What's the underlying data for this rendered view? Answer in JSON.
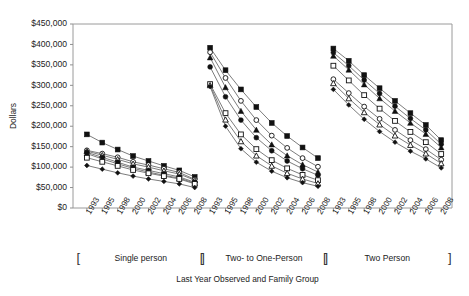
{
  "chart_data": {
    "type": "line",
    "title": "",
    "xlabel": "Last Year Observed and Family Group",
    "ylabel": "Dollars",
    "ylim": [
      0,
      450000
    ],
    "ytick_labels": [
      "$0",
      "$50,000",
      "$100,000",
      "$150,000",
      "$200,000",
      "$250,000",
      "$300,000",
      "$350,000",
      "$400,000",
      "$450,000"
    ],
    "ytick_values": [
      0,
      50000,
      100000,
      150000,
      200000,
      250000,
      300000,
      350000,
      400000,
      450000
    ],
    "grid": false,
    "legend": "none",
    "categories": [
      "1993",
      "1995",
      "1998",
      "2000",
      "2002",
      "2004",
      "2006",
      "2008"
    ],
    "groups": [
      {
        "name": "Single person",
        "x_labels": [
          "1993",
          "1995",
          "1998",
          "2000",
          "2002",
          "2004",
          "2006",
          "2008"
        ],
        "series": [
          {
            "name": "series-1",
            "marker": "filled-square",
            "values": [
              180000,
              160000,
              143000,
              127000,
              115000,
              103000,
              92000,
              76000
            ]
          },
          {
            "name": "series-2",
            "marker": "open-circle",
            "values": [
              141000,
              133000,
              124000,
              113000,
              105000,
              96000,
              87000,
              70000
            ]
          },
          {
            "name": "series-3",
            "marker": "open-triangle",
            "values": [
              139000,
              129000,
              119000,
              108000,
              100000,
              91000,
              83000,
              68000
            ]
          },
          {
            "name": "series-4",
            "marker": "filled-circle",
            "values": [
              136000,
              124000,
              112000,
              100000,
              92000,
              84000,
              76000,
              63000
            ]
          },
          {
            "name": "series-5",
            "marker": "filled-triangle",
            "values": [
              133000,
              120000,
              108000,
              97000,
              88000,
              80000,
              73000,
              61000
            ]
          },
          {
            "name": "series-6",
            "marker": "open-square",
            "values": [
              123000,
              113000,
              103000,
              93000,
              85000,
              78000,
              71000,
              59000
            ]
          },
          {
            "name": "series-7",
            "marker": "filled-diamond",
            "values": [
              104000,
              95000,
              86000,
              78000,
              71000,
              65000,
              59000,
              50000
            ]
          }
        ]
      },
      {
        "name": "Two- to One-Person",
        "x_labels": [
          "1993",
          "1995",
          "1998",
          "2000",
          "2002",
          "2004",
          "2006",
          "2008"
        ],
        "series": [
          {
            "name": "series-1",
            "marker": "filled-square",
            "values": [
              392000,
              337000,
              290000,
              247000,
              208000,
              176000,
              148000,
              122000
            ]
          },
          {
            "name": "series-2",
            "marker": "open-circle",
            "values": [
              381000,
              318000,
              262000,
              215000,
              177000,
              147000,
              122000,
              101000
            ]
          },
          {
            "name": "series-3",
            "marker": "filled-triangle",
            "values": [
              368000,
              295000,
              237000,
              191000,
              155000,
              128000,
              106000,
              88000
            ]
          },
          {
            "name": "series-4",
            "marker": "filled-circle",
            "values": [
              345000,
              272000,
              215000,
              172000,
              140000,
              115000,
              96000,
              80000
            ]
          },
          {
            "name": "series-5",
            "marker": "open-square",
            "values": [
              303000,
              232000,
              180000,
              144000,
              117000,
              97000,
              81000,
              68000
            ]
          },
          {
            "name": "series-6",
            "marker": "open-triangle",
            "values": [
              300000,
              216000,
              163000,
              128000,
              103000,
              85000,
              71000,
              60000
            ]
          },
          {
            "name": "series-7",
            "marker": "filled-diamond",
            "values": [
              297000,
              200000,
              145000,
              112000,
              90000,
              74000,
              62000,
              53000
            ]
          }
        ]
      },
      {
        "name": "Two Person",
        "x_labels": [
          "1993",
          "1995",
          "1998",
          "2000",
          "2002",
          "2004",
          "2006",
          "2008"
        ],
        "series": [
          {
            "name": "series-1",
            "marker": "filled-square",
            "values": [
              390000,
              360000,
              325000,
              293000,
              262000,
              232000,
              203000,
              166000
            ]
          },
          {
            "name": "series-2",
            "marker": "filled-circle",
            "values": [
              380000,
              348000,
              313000,
              280000,
              249000,
              219000,
              191000,
              156000
            ]
          },
          {
            "name": "series-3",
            "marker": "filled-triangle",
            "values": [
              372000,
              338000,
              302000,
              268000,
              237000,
              208000,
              181000,
              148000
            ]
          },
          {
            "name": "series-4",
            "marker": "open-square",
            "values": [
              348000,
              312000,
              276000,
              243000,
              213000,
              186000,
              161000,
              132000
            ]
          },
          {
            "name": "series-5",
            "marker": "open-circle",
            "values": [
              315000,
              281000,
              248000,
              218000,
              191000,
              166000,
              144000,
              118000
            ]
          },
          {
            "name": "series-6",
            "marker": "open-triangle",
            "values": [
              305000,
              268000,
              234000,
              204000,
              177000,
              154000,
              133000,
              109000
            ]
          },
          {
            "name": "series-7",
            "marker": "filled-diamond",
            "values": [
              290000,
              252000,
              217000,
              187000,
              161000,
              139000,
              120000,
              98000
            ]
          }
        ]
      }
    ]
  },
  "axis": {
    "ylabel": "Dollars",
    "xlabel": "Last Year Observed and Family Group"
  },
  "brackets": {
    "open": "[",
    "close": "]"
  }
}
